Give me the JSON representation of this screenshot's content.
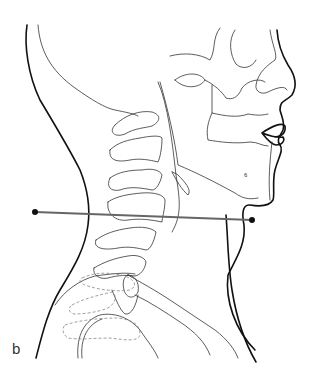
{
  "figure": {
    "panel_label": "b",
    "measurement_line": {
      "start": [
        35,
        212
      ],
      "end": [
        252,
        220
      ],
      "color": "#666666",
      "endpoint_color": "#111111"
    }
  }
}
